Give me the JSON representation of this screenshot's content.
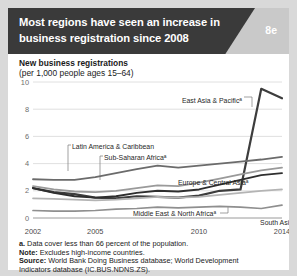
{
  "header": {
    "title_line1": "Most regions have seen an increase in",
    "title_line2": "business registration since 2008",
    "badge": "8e",
    "dark_color": "#3a3a3a",
    "panel_color": "#c9c9c9"
  },
  "subtitle": {
    "line1": "New business registrations",
    "line2": "(per 1,000 people ages 15–64)"
  },
  "notes": {
    "footnote_a": "a. Data cover less than 66 percent of the population.",
    "note_label": "Note:",
    "note_text": " Excludes high-income countries.",
    "source_label": "Source:",
    "source_text": " World Bank Doing Business database; World Development",
    "source_text2": "Indicators database (IC.BUS.NDNS.ZS)."
  },
  "chart_data": {
    "type": "line",
    "title": "New business registrations (per 1,000 people ages 15–64)",
    "xlabel": "",
    "ylabel": "New business registrations (per 1,000 people ages 15–64)",
    "xlim": [
      2002,
      2014
    ],
    "ylim": [
      0,
      10
    ],
    "yticks": [
      0,
      2,
      4,
      6,
      8,
      10
    ],
    "xticks": [
      2002,
      2005,
      2010,
      2014
    ],
    "xtick_labels": [
      "2002",
      "2005",
      "2010",
      "2014"
    ],
    "ytick_labels": [
      "0",
      "2",
      "4",
      "6",
      "8",
      "10"
    ],
    "grid": "horizontal",
    "legend": "inline-labels",
    "x": [
      2002,
      2003,
      2004,
      2005,
      2006,
      2007,
      2008,
      2009,
      2010,
      2011,
      2012,
      2013,
      2014
    ],
    "series": [
      {
        "name": "East Asia & Pacific",
        "label": "East Asia & Pacific",
        "superscript": "a",
        "color": "#3d3d3d",
        "width": 2.2,
        "values": [
          2.2,
          1.9,
          1.75,
          1.5,
          1.45,
          1.6,
          1.55,
          1.5,
          1.65,
          2.0,
          2.1,
          9.5,
          8.8
        ]
      },
      {
        "name": "Latin America & Caribbean",
        "label": "Latin America & Caribbean",
        "superscript": "",
        "color": "#6b6b6b",
        "width": 1.8,
        "values": [
          2.85,
          2.8,
          2.8,
          3.0,
          3.3,
          3.6,
          3.85,
          3.7,
          3.85,
          4.0,
          4.15,
          4.3,
          4.5
        ]
      },
      {
        "name": "Sub-Saharan Africa",
        "label": "Sub-Saharan Africa",
        "superscript": "a",
        "color": "#9a9a9a",
        "width": 1.8,
        "values": [
          2.35,
          2.1,
          1.95,
          1.9,
          2.0,
          2.2,
          2.4,
          2.35,
          2.6,
          2.9,
          3.2,
          3.5,
          3.7
        ]
      },
      {
        "name": "Europe & Central Asia",
        "label": "Europe & Central Asia",
        "superscript": "a",
        "color": "#2e2e2e",
        "width": 1.9,
        "values": [
          2.2,
          1.85,
          1.6,
          1.5,
          1.6,
          1.85,
          2.0,
          1.95,
          2.1,
          2.45,
          2.8,
          3.15,
          3.3
        ]
      },
      {
        "name": "Middle East & North Africa",
        "label": "Middle East & North Africa",
        "superscript": "a",
        "color": "#b4b4b4",
        "width": 1.7,
        "values": [
          1.45,
          1.4,
          1.35,
          1.3,
          1.35,
          1.45,
          1.55,
          1.5,
          1.55,
          1.7,
          1.85,
          2.0,
          2.1
        ]
      },
      {
        "name": "South Asia",
        "label": "South Asia",
        "superscript": "",
        "color": "#8f8f8f",
        "width": 1.7,
        "values": [
          0.55,
          0.5,
          0.5,
          0.55,
          0.65,
          0.7,
          0.8,
          0.75,
          0.8,
          0.85,
          0.8,
          0.7,
          0.95
        ]
      }
    ],
    "annotations": [
      {
        "text": "East Asia & Pacific",
        "sup": "a",
        "x": 186,
        "y": 95
      },
      {
        "text": "Latin America & Caribbean",
        "sup": "",
        "x": 64,
        "y": 141
      },
      {
        "text": "Sub-Saharan Africa",
        "sup": "a",
        "x": 96,
        "y": 152
      },
      {
        "text": "Europe & Central Asia",
        "sup": "a",
        "x": 170,
        "y": 177
      },
      {
        "text": "Middle East & North Africa",
        "sup": "a",
        "x": 125,
        "y": 208
      },
      {
        "text": "South Asia",
        "sup": "",
        "x": 237,
        "y": 217
      }
    ]
  }
}
